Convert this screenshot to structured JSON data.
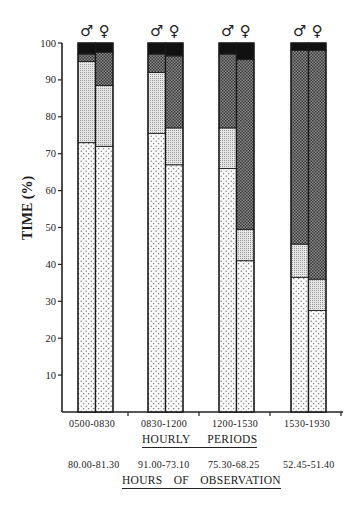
{
  "chart_data": {
    "type": "bar",
    "stacked": true,
    "title": "",
    "ylabel": "TIME (%)",
    "xlabel": "HOURLY PERIODS",
    "secondary_xlabel": "HOURS OF OBSERVATION",
    "ylim": [
      0,
      100
    ],
    "yticks": [
      10,
      20,
      30,
      40,
      50,
      60,
      70,
      80,
      90,
      100
    ],
    "grid": false,
    "legend": "none (patterns only)",
    "categories": [
      "0500-0830",
      "0830-1200",
      "1200-1530",
      "1530-1930"
    ],
    "hours_of_observation": [
      "80.00-81.30",
      "91.00-73.10",
      "75.30-68.25",
      "52.45-51.40"
    ],
    "sex_symbols": [
      "♂",
      "♀"
    ],
    "bars": [
      {
        "period": "0500-0830",
        "sex": "male",
        "segments": [
          73,
          22,
          2,
          3
        ]
      },
      {
        "period": "0500-0830",
        "sex": "female",
        "segments": [
          72,
          16.5,
          9,
          2.5
        ]
      },
      {
        "period": "0830-1200",
        "sex": "male",
        "segments": [
          75.5,
          16.5,
          5,
          3
        ]
      },
      {
        "period": "0830-1200",
        "sex": "female",
        "segments": [
          67,
          10,
          19.5,
          3.5
        ]
      },
      {
        "period": "1200-1530",
        "sex": "male",
        "segments": [
          66,
          11,
          20,
          3
        ]
      },
      {
        "period": "1200-1530",
        "sex": "female",
        "segments": [
          41,
          8.5,
          46,
          4.5
        ]
      },
      {
        "period": "1530-1930",
        "sex": "male",
        "segments": [
          36.5,
          9,
          52.5,
          2
        ]
      },
      {
        "period": "1530-1930",
        "sex": "female",
        "segments": [
          27.5,
          8.5,
          62,
          2
        ]
      }
    ],
    "segment_patterns": [
      "sparse-dots",
      "fine-stipple",
      "dark-crosshatch",
      "solid-black"
    ]
  },
  "axis": {
    "y_title": "TIME (%)",
    "x_title_1": "HOURLY  PERIODS",
    "x_title_2": "HOURS  OF  OBSERVATION"
  },
  "labels": {
    "periods": [
      "0500-0830",
      "0830-1200",
      "1200-1530",
      "1530-1930"
    ],
    "hours": [
      "80.00-81.30",
      "91.00-73.10",
      "75.30-68.25",
      "52.45-51.40"
    ]
  }
}
